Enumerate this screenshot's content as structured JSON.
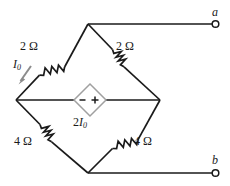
{
  "figure": {
    "type": "circuit-diagram",
    "background_color": "#ffffff",
    "wire_color": "#1a1a1a",
    "source_color": "#9a9a9a",
    "arrow_color": "#8c8c8c"
  },
  "components": {
    "resistor_top_left": {
      "label": "2 Ω",
      "value": "2",
      "unit": "Ω"
    },
    "resistor_top_right": {
      "label": "2 Ω",
      "value": "2",
      "unit": "Ω"
    },
    "resistor_bottom_left": {
      "label": "4 Ω",
      "value": "4",
      "unit": "Ω"
    },
    "resistor_bottom_right": {
      "label": "4 Ω",
      "value": "4",
      "unit": "Ω"
    },
    "dependent_source": {
      "shape": "diamond",
      "label_main": "2",
      "label_var": "I",
      "label_sub": "0",
      "polarity_left": "−",
      "polarity_right": "+"
    }
  },
  "currents": {
    "i0": {
      "symbol": "I",
      "subscript": "0",
      "direction": "down-left"
    }
  },
  "terminals": {
    "a": {
      "label": "a"
    },
    "b": {
      "label": "b"
    }
  }
}
